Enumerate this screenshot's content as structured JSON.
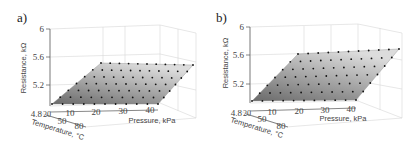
{
  "figure": {
    "panels": [
      {
        "label": "a)"
      },
      {
        "label": "b)"
      }
    ]
  },
  "chart_data": [
    {
      "type": "surface3d",
      "panel": "a)",
      "title": "",
      "xlabel": "Pressure, kPa",
      "ylabel": "Temperature, °C",
      "zlabel": "Resistance, kΩ",
      "x_ticks": [
        "10",
        "20",
        "30",
        "40"
      ],
      "y_ticks": [
        "20",
        "50",
        "80"
      ],
      "z_ticks": [
        "4.8",
        "5.2",
        "5.6",
        "6"
      ],
      "xlim": [
        0,
        40
      ],
      "ylim": [
        20,
        80
      ],
      "zlim": [
        4.8,
        6.0
      ],
      "grid": true,
      "surface": {
        "shape": "plane",
        "description": "Grey gradient planar fit with black measurement points on a regular grid",
        "grid_points": {
          "pressure_count": 11,
          "temperature_count": 7
        },
        "z_range_approx": [
          5.0,
          5.45
        ]
      }
    },
    {
      "type": "surface3d",
      "panel": "b)",
      "title": "",
      "xlabel": "Pressure, kPa",
      "ylabel": "Temperature, °C",
      "zlabel": "Resistance, kΩ",
      "x_ticks": [
        "10",
        "20",
        "30",
        "40"
      ],
      "y_ticks": [
        "20",
        "50",
        "80"
      ],
      "z_ticks": [
        "4.8",
        "5.2",
        "5.6",
        "6"
      ],
      "xlim": [
        0,
        45
      ],
      "ylim": [
        20,
        80
      ],
      "zlim": [
        4.8,
        6.0
      ],
      "grid": true,
      "surface": {
        "shape": "plane",
        "description": "Grey gradient planar fit with black measurement points on a regular grid",
        "grid_points": {
          "pressure_count": 11,
          "temperature_count": 7
        },
        "z_range_approx": [
          5.05,
          5.55
        ]
      }
    }
  ],
  "axes_text": {
    "a": {
      "z_ticks": [
        "6",
        "5.6",
        "5.2",
        "4.8"
      ],
      "x_ticks": [
        "10",
        "20",
        "30",
        "40"
      ],
      "y_ticks": [
        "20",
        "50",
        "80"
      ],
      "xlabel": "Pressure, kPa",
      "ylabel": "Temperature, °C",
      "zlabel": "Resistance, kΩ"
    },
    "b": {
      "z_ticks": [
        "6",
        "5.6",
        "5.2",
        "4.8"
      ],
      "x_ticks": [
        "10",
        "20",
        "30",
        "40"
      ],
      "y_ticks": [
        "20",
        "50",
        "80"
      ],
      "xlabel": "Pressure, kPa",
      "ylabel": "Temperature, °C",
      "zlabel": "Resistance, kΩ"
    }
  }
}
